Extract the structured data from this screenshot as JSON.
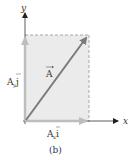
{
  "figure": {
    "caption": "(b)",
    "axes": {
      "x_label": "x",
      "y_label": "y"
    },
    "vector": {
      "label": "A",
      "arrow_over": true
    },
    "components": {
      "y_component": {
        "label_main": "A",
        "label_sub": "y",
        "unit": "j"
      },
      "x_component": {
        "label_main": "A",
        "label_sub": "x",
        "unit": "i"
      }
    },
    "colors": {
      "rectangle_fill": "#ebebeb",
      "dashed_edge": "#a0a0a0",
      "vector": "#7a7a7a",
      "component": "#b8b8b8",
      "axis": "#333333"
    }
  }
}
